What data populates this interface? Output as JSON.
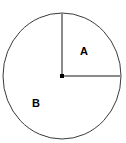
{
  "figure": {
    "kind": "circle-sector-diagram",
    "width": 126,
    "height": 143,
    "background_color": "#ffffff",
    "circle": {
      "name": "circle-outline",
      "center_x": 62,
      "center_y": 76,
      "radius_x": 59,
      "radius_y": 63,
      "stroke_color": "#3a3a3a",
      "stroke_width": 1,
      "fill": "none"
    },
    "center_point": {
      "name": "center-point",
      "x": 62,
      "y": 76,
      "size": 4,
      "color": "#000000"
    },
    "radii": [
      {
        "name": "vertical-radius",
        "from_x": 62,
        "from_y": 76,
        "to_x": 62,
        "to_y": 13,
        "stroke_color": "#8a8a8a",
        "stroke_width": 2
      },
      {
        "name": "horizontal-radius",
        "from_x": 62,
        "from_y": 76,
        "to_x": 121,
        "to_y": 76,
        "stroke_color": "#8a8a8a",
        "stroke_width": 2
      }
    ],
    "labels": [
      {
        "name": "sector-label-a",
        "text": "A",
        "region": "upper-right-quadrant",
        "x": 85,
        "y": 52
      },
      {
        "name": "sector-label-b",
        "text": "B",
        "region": "remaining-three-quarters",
        "x": 37,
        "y": 104
      }
    ]
  }
}
